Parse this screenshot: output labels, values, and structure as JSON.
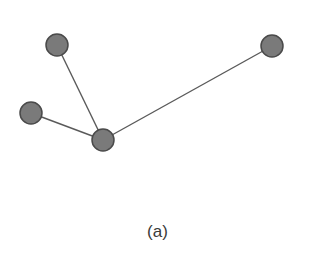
{
  "figure": {
    "caption": "(a)",
    "colors": {
      "node_fill": "#7a7a7a",
      "node_stroke": "#4a4a4a",
      "edge": "#5a5a5a",
      "background": "#ffffff"
    },
    "graph": {
      "type": "star",
      "node_radius": 11,
      "nodes": [
        {
          "id": "n1",
          "x": 57,
          "y": 45
        },
        {
          "id": "n2",
          "x": 31,
          "y": 113
        },
        {
          "id": "hub",
          "x": 103,
          "y": 140
        },
        {
          "id": "n4",
          "x": 272,
          "y": 46
        }
      ],
      "edges": [
        {
          "from": "hub",
          "to": "n1"
        },
        {
          "from": "hub",
          "to": "n2"
        },
        {
          "from": "hub",
          "to": "n4"
        }
      ]
    }
  }
}
